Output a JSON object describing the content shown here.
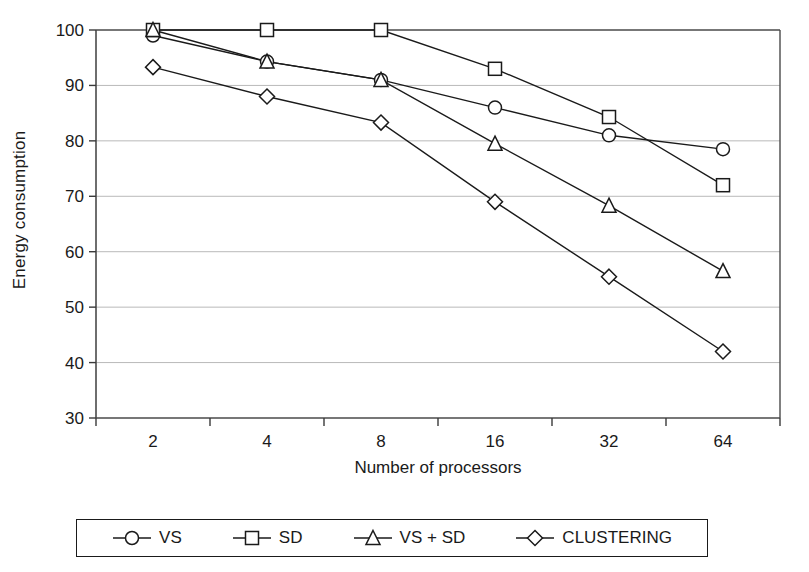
{
  "chart_data": {
    "type": "line",
    "title": "",
    "xlabel": "Number of processors",
    "ylabel": "Energy consumption",
    "categories": [
      "2",
      "4",
      "8",
      "16",
      "32",
      "64"
    ],
    "x": [
      2,
      4,
      8,
      16,
      32,
      64
    ],
    "ylim": [
      30,
      100
    ],
    "yticks": [
      30,
      40,
      50,
      60,
      70,
      80,
      90,
      100
    ],
    "ytick_labels": [
      "30",
      "40",
      "50",
      "60",
      "70",
      "80",
      "90",
      "100"
    ],
    "grid": "horizontal",
    "legend_position": "bottom",
    "series": [
      {
        "name": "VS",
        "marker": "circle",
        "color": "#1a1a1a",
        "values": [
          99.0,
          94.3,
          91.0,
          86.0,
          81.0,
          78.5
        ]
      },
      {
        "name": "SD",
        "marker": "square",
        "color": "#1a1a1a",
        "values": [
          100.0,
          100.0,
          100.0,
          93.0,
          84.3,
          72.0
        ]
      },
      {
        "name": "VS + SD",
        "marker": "triangle",
        "color": "#1a1a1a",
        "values": [
          100.0,
          94.3,
          91.0,
          79.5,
          68.3,
          56.5
        ]
      },
      {
        "name": "CLUSTERING",
        "marker": "diamond",
        "color": "#1a1a1a",
        "values": [
          93.3,
          88.0,
          83.3,
          69.0,
          55.5,
          42.0
        ]
      }
    ]
  },
  "axes": {
    "y_title": "Energy consumption",
    "x_title": "Number of processors"
  },
  "legend": {
    "items": [
      {
        "label": "VS",
        "marker": "circle-marker"
      },
      {
        "label": "SD",
        "marker": "square-marker"
      },
      {
        "label": "VS + SD",
        "marker": "triangle-marker"
      },
      {
        "label": "CLUSTERING",
        "marker": "diamond-marker"
      }
    ]
  }
}
